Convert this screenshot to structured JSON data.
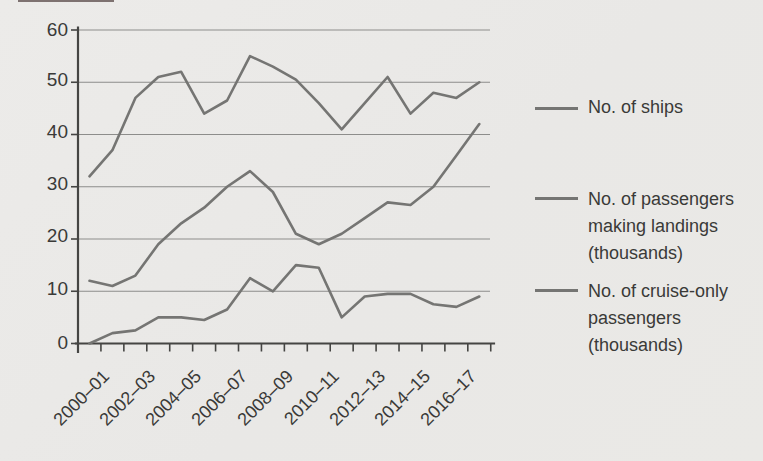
{
  "page": {
    "background_color": "#eae9e7",
    "text_color": "#3a3a38",
    "line_color": "#757573",
    "gridline_color": "#8d8d8b"
  },
  "legend": {
    "position": "right",
    "items": [
      {
        "label": "No. of ships"
      },
      {
        "label": "No. of passengers making landings (thousands)"
      },
      {
        "label": "No. of cruise-only passengers (thousands)"
      }
    ]
  },
  "chart_data": {
    "type": "line",
    "title": "",
    "xlabel": "",
    "ylabel": "",
    "ylim": [
      0,
      60
    ],
    "y_ticks": [
      0,
      10,
      20,
      30,
      40,
      50,
      60
    ],
    "y_tick_labels": [
      "60",
      "50",
      "40",
      "30",
      "20",
      "10",
      "0"
    ],
    "x_tick_labels": [
      "2000–01",
      "2002–03",
      "2004–05",
      "2006–07",
      "2008–09",
      "2010–11",
      "2012–13",
      "2014–15",
      "2016–17"
    ],
    "x_range": "one data point per season from 2000–01 to 2017–18, axis labels every second season",
    "points_per_series": 18,
    "grid": "horizontal",
    "legend_position": "right",
    "series": [
      {
        "name": "No. of ships",
        "values": [
          32,
          37,
          47,
          51,
          52,
          44,
          46.5,
          55,
          53,
          50.5,
          46,
          41,
          46,
          51,
          44,
          48,
          47,
          50
        ]
      },
      {
        "name": "No. of passengers making landings (thousands)",
        "values": [
          12,
          11,
          13,
          19,
          23,
          26,
          30,
          33,
          29,
          21,
          19,
          21,
          24,
          27,
          26.5,
          30,
          36,
          42
        ]
      },
      {
        "name": "No. of cruise-only passengers (thousands)",
        "values": [
          0,
          2,
          2.5,
          5,
          5,
          4.5,
          6.5,
          12.5,
          10,
          15,
          14.5,
          5,
          9,
          9.5,
          9.5,
          7.5,
          7,
          9
        ]
      }
    ]
  }
}
